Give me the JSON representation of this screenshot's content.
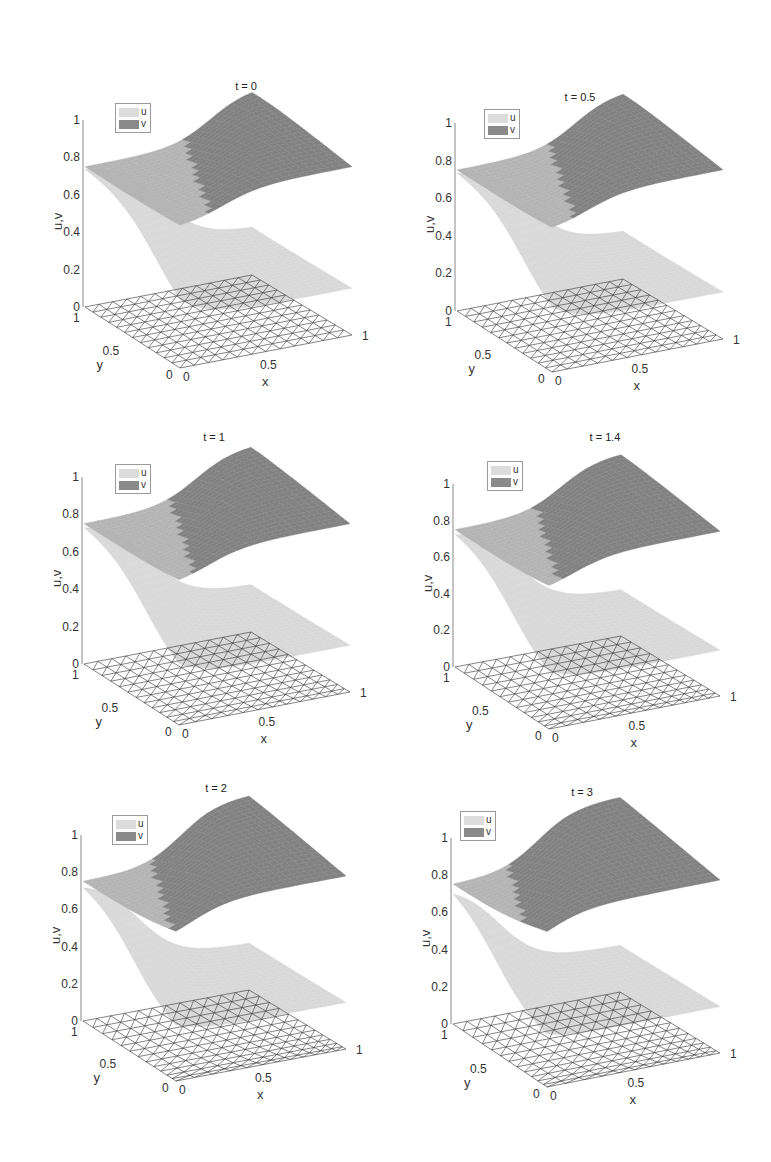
{
  "figure": {
    "title": "",
    "legend": [
      {
        "name": "u",
        "color": "#dcdcdc"
      },
      {
        "name": "v",
        "color": "#8a8a8a"
      }
    ],
    "colors": {
      "u_surface": "#d8d8d8",
      "v_surface_light": "#b4b4b4",
      "v_surface_dark": "#828282",
      "mesh": "#333333",
      "axis": "#888888"
    }
  },
  "chart_data": [
    {
      "type": "surface3d",
      "title": "t = 0",
      "t": 0,
      "xlabel": "x",
      "ylabel": "y",
      "zlabel": "u,v",
      "zticks": [
        "0",
        "0.2",
        "0.4",
        "0.6",
        "0.8",
        "1"
      ],
      "xticks": [
        "0",
        "0.5",
        "1"
      ],
      "yticks": [
        "0",
        "0.5",
        "1"
      ],
      "zlim": [
        0,
        1
      ],
      "xlim": [
        0,
        1
      ],
      "ylim": [
        0,
        1
      ],
      "legend": [
        "u",
        "v"
      ],
      "mesh": "uniform triangular",
      "series": [
        {
          "name": "u",
          "range": [
            0.2,
            0.75
          ]
        },
        {
          "name": "v",
          "range": [
            0.75,
            1.0
          ]
        }
      ]
    },
    {
      "type": "surface3d",
      "title": "t = 0.5",
      "t": 0.5,
      "xlabel": "x",
      "ylabel": "y",
      "zlabel": "u,v",
      "zticks": [
        "0",
        "0.2",
        "0.4",
        "0.6",
        "0.8",
        "1"
      ],
      "xticks": [
        "0",
        "0.5",
        "1"
      ],
      "yticks": [
        "0",
        "0.5",
        "1"
      ],
      "zlim": [
        0,
        1
      ],
      "xlim": [
        0,
        1
      ],
      "ylim": [
        0,
        1
      ],
      "legend": [
        "u",
        "v"
      ],
      "mesh": "adapted triangular",
      "series": [
        {
          "name": "u",
          "range": [
            0.2,
            0.75
          ]
        },
        {
          "name": "v",
          "range": [
            0.75,
            1.0
          ]
        }
      ]
    },
    {
      "type": "surface3d",
      "title": "t = 1",
      "t": 1,
      "xlabel": "x",
      "ylabel": "y",
      "zlabel": "u,v",
      "zticks": [
        "0",
        "0.2",
        "0.4",
        "0.6",
        "0.8",
        "1"
      ],
      "xticks": [
        "0",
        "0.5",
        "1"
      ],
      "yticks": [
        "0",
        "0.5",
        "1"
      ],
      "zlim": [
        0,
        1
      ],
      "xlim": [
        0,
        1
      ],
      "ylim": [
        0,
        1
      ],
      "legend": [
        "u",
        "v"
      ],
      "mesh": "adapted triangular",
      "series": [
        {
          "name": "u",
          "range": [
            0.2,
            0.75
          ]
        },
        {
          "name": "v",
          "range": [
            0.75,
            1.0
          ]
        }
      ]
    },
    {
      "type": "surface3d",
      "title": "t = 1.4",
      "t": 1.4,
      "xlabel": "x",
      "ylabel": "y",
      "zlabel": "u,v",
      "zticks": [
        "0",
        "0.2",
        "0.4",
        "0.6",
        "0.8",
        "1"
      ],
      "xticks": [
        "0",
        "0.5",
        "1"
      ],
      "yticks": [
        "0",
        "0.5",
        "1"
      ],
      "zlim": [
        0,
        1
      ],
      "xlim": [
        0,
        1
      ],
      "ylim": [
        0,
        1
      ],
      "legend": [
        "u",
        "v"
      ],
      "mesh": "adapted triangular",
      "series": [
        {
          "name": "u",
          "range": [
            0.2,
            0.75
          ]
        },
        {
          "name": "v",
          "range": [
            0.75,
            1.0
          ]
        }
      ]
    },
    {
      "type": "surface3d",
      "title": "t = 2",
      "t": 2,
      "xlabel": "x",
      "ylabel": "y",
      "zlabel": "u,v",
      "zticks": [
        "0",
        "0.2",
        "0.4",
        "0.6",
        "0.8",
        "1"
      ],
      "xticks": [
        "0",
        "0.5",
        "1"
      ],
      "yticks": [
        "0",
        "0.5",
        "1"
      ],
      "zlim": [
        0,
        1
      ],
      "xlim": [
        0,
        1
      ],
      "ylim": [
        0,
        1
      ],
      "legend": [
        "u",
        "v"
      ],
      "mesh": "adapted triangular",
      "series": [
        {
          "name": "u",
          "range": [
            0.2,
            0.75
          ]
        },
        {
          "name": "v",
          "range": [
            0.75,
            1.05
          ]
        }
      ]
    },
    {
      "type": "surface3d",
      "title": "t = 3",
      "t": 3,
      "xlabel": "x",
      "ylabel": "y",
      "zlabel": "u,v",
      "zticks": [
        "0",
        "0.2",
        "0.4",
        "0.6",
        "0.8",
        "1"
      ],
      "xticks": [
        "0",
        "0.5",
        "1"
      ],
      "yticks": [
        "0",
        "0.5",
        "1"
      ],
      "zlim": [
        0,
        1
      ],
      "xlim": [
        0,
        1
      ],
      "ylim": [
        0,
        1
      ],
      "legend": [
        "u",
        "v"
      ],
      "mesh": "adapted triangular",
      "series": [
        {
          "name": "u",
          "range": [
            0.2,
            0.75
          ]
        },
        {
          "name": "v",
          "range": [
            0.75,
            1.05
          ]
        }
      ]
    }
  ],
  "layout": [
    {
      "ax": 83,
      "z0": 307,
      "z1": 120,
      "title_x": 246,
      "title_y": 80,
      "legend_x": 115,
      "legend_y": 103,
      "front_x": 180,
      "front_y": 368,
      "back_x": 252,
      "back_y": 275,
      "right_x": 352,
      "right_y": 335,
      "vpeak": 1.0,
      "phase": 0
    },
    {
      "ax": 455,
      "z0": 311,
      "z1": 123,
      "title_x": 580,
      "title_y": 91,
      "legend_x": 484,
      "legend_y": 109,
      "front_x": 552,
      "front_y": 372,
      "back_x": 623,
      "back_y": 279,
      "right_x": 723,
      "right_y": 339,
      "vpeak": 1.0,
      "phase": 0.5
    },
    {
      "ax": 82,
      "z0": 664,
      "z1": 477,
      "title_x": 214,
      "title_y": 431,
      "legend_x": 115,
      "legend_y": 464,
      "front_x": 179,
      "front_y": 725,
      "back_x": 251,
      "back_y": 632,
      "right_x": 350,
      "right_y": 692,
      "vpeak": 1.0,
      "phase": 1
    },
    {
      "ax": 453,
      "z0": 667,
      "z1": 484,
      "title_x": 605,
      "title_y": 431,
      "legend_x": 487,
      "legend_y": 461,
      "front_x": 549,
      "front_y": 729,
      "back_x": 621,
      "back_y": 636,
      "right_x": 720,
      "right_y": 696,
      "vpeak": 1.0,
      "phase": 1.4
    },
    {
      "ax": 81,
      "z0": 1021,
      "z1": 835,
      "title_x": 216,
      "title_y": 782,
      "legend_x": 112,
      "legend_y": 815,
      "front_x": 176,
      "front_y": 1081,
      "back_x": 249,
      "back_y": 990,
      "right_x": 346,
      "right_y": 1049,
      "vpeak": 1.05,
      "phase": 2
    },
    {
      "ax": 451,
      "z0": 1024,
      "z1": 838,
      "title_x": 582,
      "title_y": 786,
      "legend_x": 460,
      "legend_y": 811,
      "front_x": 547,
      "front_y": 1087,
      "back_x": 620,
      "back_y": 992,
      "right_x": 720,
      "right_y": 1053,
      "vpeak": 1.05,
      "phase": 3
    }
  ]
}
